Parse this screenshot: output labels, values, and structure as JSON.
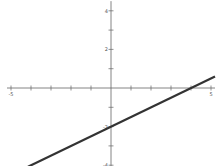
{
  "corner_label": "",
  "chart_data": {
    "type": "line",
    "title": "",
    "xlabel": "",
    "ylabel": "",
    "xlim": [
      -5.2,
      5.2
    ],
    "ylim": [
      -4.1,
      4.5
    ],
    "grid": false,
    "legend": null,
    "x_ticks": [
      -5,
      -4,
      -3,
      -2,
      -1,
      1,
      2,
      3,
      4,
      5
    ],
    "x_tick_labels": [
      {
        "value": -5,
        "label": "-5"
      },
      {
        "value": 5,
        "label": "5"
      }
    ],
    "y_ticks": [
      -4,
      -3,
      -2,
      -1,
      1,
      2,
      3,
      4
    ],
    "y_tick_labels": [
      {
        "value": 4,
        "label": "4"
      },
      {
        "value": 2,
        "label": "2"
      },
      {
        "value": -2,
        "label": "-2"
      },
      {
        "value": -4,
        "label": "-4"
      }
    ],
    "series": [
      {
        "name": "y = 0.5x - 2",
        "equation": "y = 0.5x - 2",
        "slope": 0.5,
        "intercept": -2,
        "x": [
          -4.15,
          5.2
        ],
        "y": [
          -4.08,
          0.6
        ],
        "color": "#333333"
      }
    ],
    "layout": {
      "origin_px": [
        111,
        88
      ],
      "px_per_unit_x": 20,
      "px_per_unit_y": 19.3
    }
  }
}
